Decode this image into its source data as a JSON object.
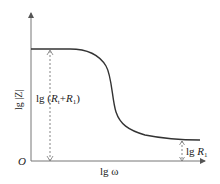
{
  "diagram": {
    "y_axis_label": "lg |Z|",
    "x_axis_label": "lg ω",
    "origin_label": "O",
    "high_freq_label_prefix": "lg ",
    "high_freq_label_R": "R",
    "high_freq_label_sub": "1",
    "low_freq_label_prefix": "lg (",
    "low_freq_label_R1": "R",
    "low_freq_label_sub1": "t",
    "low_freq_label_plus": "+",
    "low_freq_label_R2": "R",
    "low_freq_label_sub2": "1",
    "low_freq_label_suffix": ")",
    "line_color": "#333333",
    "dash_color": "#555555"
  }
}
